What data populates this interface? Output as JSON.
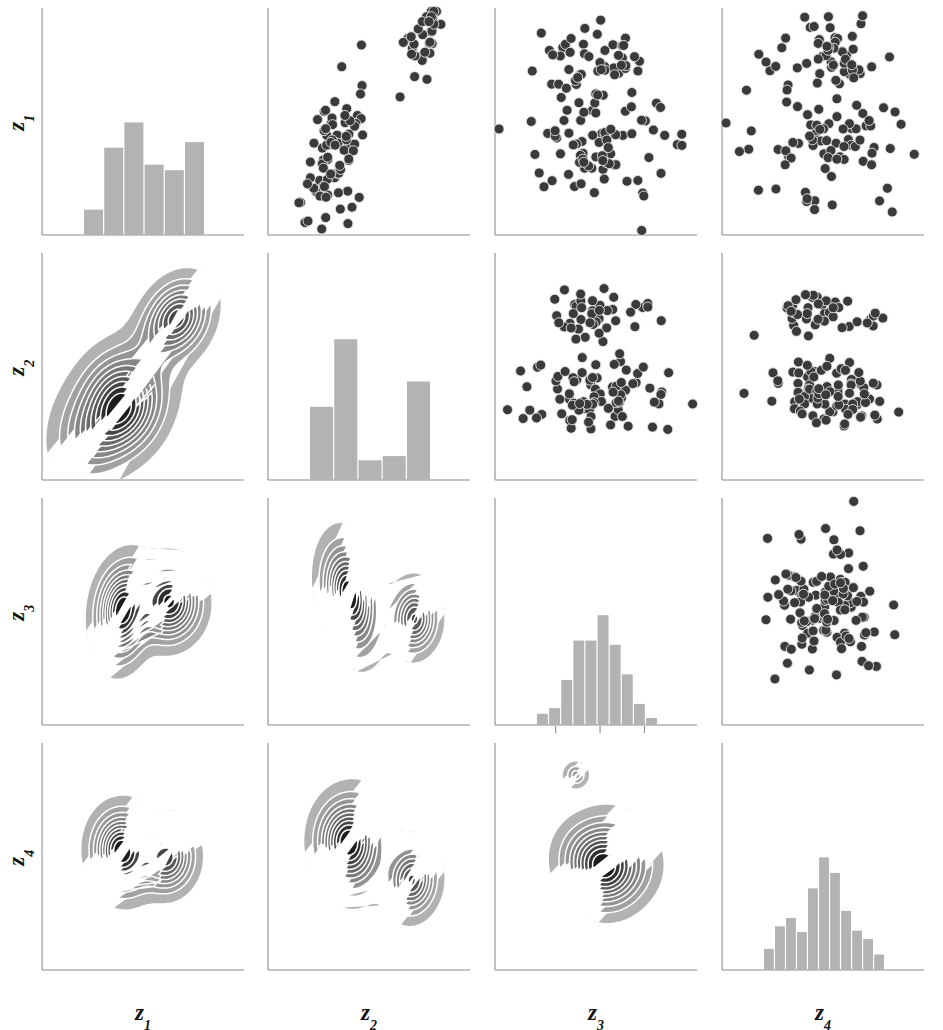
{
  "figure": {
    "kind": "scatterplot-matrix",
    "variables": [
      "z1",
      "z2",
      "z3",
      "z4"
    ],
    "n_rows": 4,
    "n_cols": 4,
    "background": "#ffffff",
    "axis_color": "#808080",
    "bar_color": "#b3b3b3",
    "point_color": "#3a3a3a",
    "contour_line_color": "#ffffff"
  },
  "labels": {
    "rows": [
      {
        "base": "z",
        "sub": "1",
        "text": "z1"
      },
      {
        "base": "z",
        "sub": "2",
        "text": "z2"
      },
      {
        "base": "z",
        "sub": "3",
        "text": "z3"
      },
      {
        "base": "z",
        "sub": "4",
        "text": "z4"
      }
    ],
    "cols": [
      {
        "base": "z",
        "sub": "1",
        "text": "z1"
      },
      {
        "base": "z",
        "sub": "2",
        "text": "z2"
      },
      {
        "base": "z",
        "sub": "3",
        "text": "z3"
      },
      {
        "base": "z",
        "sub": "4",
        "text": "z4"
      }
    ]
  },
  "chart_data": {
    "type": "scatter",
    "title": "",
    "xlabel": "",
    "ylabel": "",
    "panels": [
      {
        "row": 0,
        "col": 0,
        "kind": "histogram",
        "xlabel": "z1",
        "ylabel": "z1",
        "bins": 6,
        "values": [
          0.18,
          0.62,
          0.8,
          0.5,
          0.46,
          0.66
        ],
        "bar_color": "#b3b3b3"
      },
      {
        "row": 0,
        "col": 1,
        "kind": "scatter",
        "xlabel": "z2",
        "ylabel": "z1",
        "n_points": 110,
        "clusters": [
          {
            "name": "lower-left",
            "cx": 0.33,
            "cy": 0.34,
            "sx": 0.075,
            "sy": 0.17,
            "rho": 0.55,
            "n": 78
          },
          {
            "name": "upper-right",
            "cx": 0.76,
            "cy": 0.84,
            "sx": 0.055,
            "sy": 0.1,
            "rho": 0.55,
            "n": 32
          }
        ]
      },
      {
        "row": 0,
        "col": 2,
        "kind": "scatter",
        "xlabel": "z3",
        "ylabel": "z1",
        "n_points": 125,
        "clusters": [
          {
            "name": "upper-band",
            "cx": 0.5,
            "cy": 0.79,
            "sx": 0.16,
            "sy": 0.08,
            "rho": 0.0,
            "n": 45
          },
          {
            "name": "lower-band",
            "cx": 0.5,
            "cy": 0.4,
            "sx": 0.19,
            "sy": 0.13,
            "rho": 0.0,
            "n": 80
          }
        ]
      },
      {
        "row": 0,
        "col": 3,
        "kind": "scatter",
        "xlabel": "z4",
        "ylabel": "z1",
        "n_points": 125,
        "clusters": [
          {
            "name": "upper-band",
            "cx": 0.5,
            "cy": 0.79,
            "sx": 0.16,
            "sy": 0.08,
            "rho": 0.0,
            "n": 45
          },
          {
            "name": "lower-band",
            "cx": 0.5,
            "cy": 0.4,
            "sx": 0.19,
            "sy": 0.13,
            "rho": 0.0,
            "n": 80
          }
        ]
      },
      {
        "row": 1,
        "col": 0,
        "kind": "contour",
        "xlabel": "z1",
        "ylabel": "z2",
        "modes": [
          {
            "cx": 0.36,
            "cy": 0.31,
            "sx": 0.115,
            "sy": 0.165,
            "rot": -42,
            "w": 1.0
          },
          {
            "cx": 0.66,
            "cy": 0.7,
            "sx": 0.085,
            "sy": 0.115,
            "rot": -42,
            "w": 0.72
          }
        ],
        "levels": 10
      },
      {
        "row": 1,
        "col": 1,
        "kind": "histogram",
        "xlabel": "z2",
        "ylabel": "z2",
        "bins": 5,
        "values": [
          0.52,
          1.0,
          0.14,
          0.17,
          0.7
        ],
        "bar_color": "#b3b3b3"
      },
      {
        "row": 1,
        "col": 2,
        "kind": "scatter",
        "xlabel": "z3",
        "ylabel": "z2",
        "n_points": 125,
        "clusters": [
          {
            "name": "upper-band",
            "cx": 0.52,
            "cy": 0.74,
            "sx": 0.14,
            "sy": 0.055,
            "rho": 0.2,
            "n": 42
          },
          {
            "name": "lower-band",
            "cx": 0.52,
            "cy": 0.38,
            "sx": 0.17,
            "sy": 0.075,
            "rho": 0.1,
            "n": 83
          }
        ]
      },
      {
        "row": 1,
        "col": 3,
        "kind": "scatter",
        "xlabel": "z4",
        "ylabel": "z2",
        "n_points": 125,
        "clusters": [
          {
            "name": "upper-band",
            "cx": 0.52,
            "cy": 0.74,
            "sx": 0.15,
            "sy": 0.05,
            "rho": 0.0,
            "n": 42
          },
          {
            "name": "lower-band",
            "cx": 0.52,
            "cy": 0.38,
            "sx": 0.18,
            "sy": 0.075,
            "rho": 0.0,
            "n": 83
          }
        ]
      },
      {
        "row": 2,
        "col": 0,
        "kind": "contour",
        "xlabel": "z1",
        "ylabel": "z3",
        "modes": [
          {
            "cx": 0.4,
            "cy": 0.5,
            "sx": 0.075,
            "sy": 0.125,
            "rot": -10,
            "w": 0.88
          },
          {
            "cx": 0.63,
            "cy": 0.54,
            "sx": 0.085,
            "sy": 0.095,
            "rot": 0,
            "w": 1.0
          }
        ],
        "levels": 10
      },
      {
        "row": 2,
        "col": 1,
        "kind": "contour",
        "xlabel": "z2",
        "ylabel": "z3",
        "modes": [
          {
            "cx": 0.41,
            "cy": 0.57,
            "sx": 0.075,
            "sy": 0.14,
            "rot": 12,
            "w": 1.0
          },
          {
            "cx": 0.72,
            "cy": 0.47,
            "sx": 0.065,
            "sy": 0.085,
            "rot": 0,
            "w": 0.82
          }
        ],
        "levels": 10
      },
      {
        "row": 2,
        "col": 2,
        "kind": "histogram",
        "xlabel": "z3",
        "ylabel": "z3",
        "bins": 10,
        "values": [
          0.08,
          0.12,
          0.32,
          0.6,
          0.6,
          0.78,
          0.57,
          0.36,
          0.15,
          0.05
        ],
        "bar_color": "#b3b3b3",
        "ticks": [
          0.3,
          0.52,
          0.74
        ]
      },
      {
        "row": 2,
        "col": 3,
        "kind": "scatter",
        "xlabel": "z4",
        "ylabel": "z3",
        "n_points": 120,
        "clusters": [
          {
            "name": "main",
            "cx": 0.5,
            "cy": 0.52,
            "sx": 0.135,
            "sy": 0.145,
            "rho": 0.0,
            "n": 120
          }
        ]
      },
      {
        "row": 3,
        "col": 0,
        "kind": "contour",
        "xlabel": "z1",
        "ylabel": "z4",
        "modes": [
          {
            "cx": 0.4,
            "cy": 0.52,
            "sx": 0.085,
            "sy": 0.105,
            "rot": 0,
            "w": 1.0
          },
          {
            "cx": 0.62,
            "cy": 0.5,
            "sx": 0.075,
            "sy": 0.085,
            "rot": 0,
            "w": 0.92
          }
        ],
        "levels": 10
      },
      {
        "row": 3,
        "col": 1,
        "kind": "contour",
        "xlabel": "z2",
        "ylabel": "z4",
        "modes": [
          {
            "cx": 0.41,
            "cy": 0.56,
            "sx": 0.095,
            "sy": 0.12,
            "rot": 0,
            "w": 1.0
          },
          {
            "cx": 0.71,
            "cy": 0.4,
            "sx": 0.07,
            "sy": 0.09,
            "rot": 0,
            "w": 0.8
          }
        ],
        "levels": 10
      },
      {
        "row": 3,
        "col": 2,
        "kind": "contour",
        "xlabel": "z3",
        "ylabel": "z4",
        "modes": [
          {
            "cx": 0.55,
            "cy": 0.47,
            "sx": 0.115,
            "sy": 0.105,
            "rot": -8,
            "w": 1.0
          }
        ],
        "island": {
          "cx": 0.4,
          "cy": 0.86,
          "sx": 0.035,
          "sy": 0.032
        },
        "levels": 10
      },
      {
        "row": 3,
        "col": 3,
        "kind": "histogram",
        "xlabel": "z4",
        "ylabel": "z4",
        "bins": 11,
        "values": [
          0.15,
          0.31,
          0.37,
          0.27,
          0.58,
          0.8,
          0.69,
          0.42,
          0.28,
          0.22,
          0.11
        ],
        "bar_color": "#b3b3b3"
      }
    ]
  }
}
